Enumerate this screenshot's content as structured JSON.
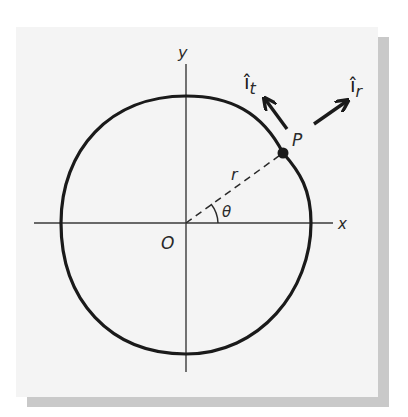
{
  "figure": {
    "colors": {
      "panel": "#f4f4f4",
      "shadow": "#c9c9c9",
      "ink": "#1a1a1a"
    },
    "axes": {
      "x_label": "x",
      "y_label": "y",
      "origin_label": "O"
    },
    "point": {
      "label": "P"
    },
    "radius_label": "r",
    "angle_label": "θ",
    "vectors": {
      "tangential": {
        "base": "î",
        "subscript": "t"
      },
      "radial": {
        "base": "î",
        "subscript": "r"
      }
    }
  }
}
